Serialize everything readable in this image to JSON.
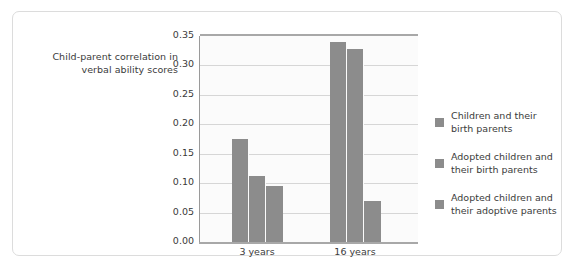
{
  "chart_data": {
    "type": "bar",
    "title": "",
    "xlabel": "",
    "ylabel": "Child-parent correlation\nin verbal ability scores",
    "categories": [
      "3 years",
      "16 years"
    ],
    "series": [
      {
        "name": "Children and their\nbirth parents",
        "values": [
          0.175,
          0.34
        ]
      },
      {
        "name": "Adopted children and\ntheir birth parents",
        "values": [
          0.112,
          0.328
        ]
      },
      {
        "name": "Adopted children and\ntheir adoptive parents",
        "values": [
          0.096,
          0.069
        ]
      }
    ],
    "ylim": [
      0.0,
      0.35
    ],
    "ytick_labels": [
      "0.35",
      "0.30",
      "0.25",
      "0.20",
      "0.15",
      "0.10",
      "0.05",
      "0.00"
    ],
    "ytick_values": [
      0.35,
      0.3,
      0.25,
      0.2,
      0.15,
      0.1,
      0.05,
      0.0
    ],
    "grid": true,
    "legend_position": "right",
    "bar_color": "#8c8c8c",
    "plot_background": "#fbfbfb",
    "gridline_color": "#d6d6d6",
    "axis_color": "#a8a8a8",
    "frame_border_color": "#dcdcdc"
  }
}
